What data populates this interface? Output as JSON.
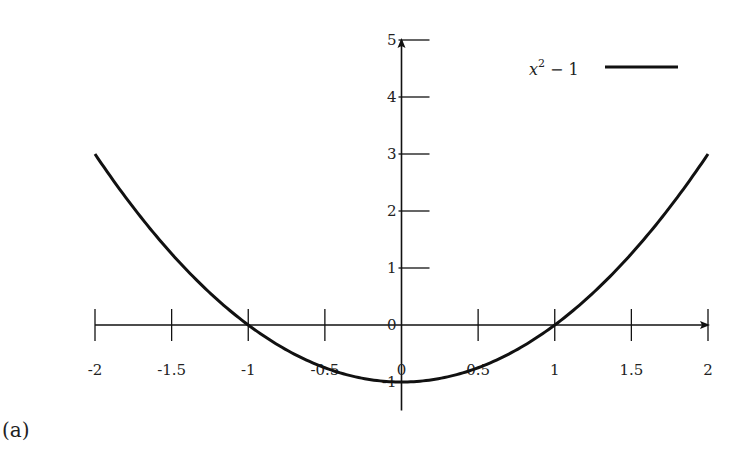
{
  "chart_data": {
    "type": "line",
    "title": "",
    "xlabel": "",
    "ylabel": "",
    "xlim": [
      -2,
      2
    ],
    "ylim": [
      -1,
      5
    ],
    "grid": false,
    "legend_position": "upper right",
    "x_ticks": [
      "-2",
      "-1.5",
      "-1",
      "-0.5",
      "0",
      "0.5",
      "1",
      "1.5",
      "2"
    ],
    "y_ticks": [
      "-1",
      "0",
      "1",
      "2",
      "3",
      "4",
      "5"
    ],
    "series": [
      {
        "name": "x^2 - 1",
        "function": "x^2 - 1",
        "x": [
          -2,
          -1.5,
          -1,
          -0.5,
          0,
          0.5,
          1,
          1.5,
          2
        ],
        "y": [
          3,
          1.25,
          0,
          -0.75,
          -1,
          -0.75,
          0,
          1.25,
          3
        ],
        "color": "#111111"
      }
    ]
  },
  "legend": {
    "label_base": "x",
    "label_sup": "2",
    "label_rest": " − 1"
  },
  "caption": "(a)"
}
